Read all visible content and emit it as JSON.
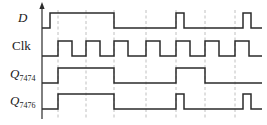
{
  "figure": {
    "type": "digital-timing-diagram",
    "width": 267,
    "height": 125,
    "background_color": "#ffffff",
    "wave_color": "#2b2b2b",
    "grid_color": "#b9b9b9"
  },
  "axis": {
    "name": "vertical-time-axis",
    "x": 42,
    "y_top": 8,
    "y_bottom": 119,
    "arrow": "up-arrow"
  },
  "gridlines": {
    "x_positions": [
      58,
      86,
      114,
      146,
      176,
      205,
      235
    ],
    "y_top": 10,
    "y_bottom": 120,
    "style": "dashed"
  },
  "signals": [
    {
      "name": "D",
      "label": "D",
      "label_style": "italic",
      "subscript": "",
      "label_x": 18,
      "label_y": 22,
      "row_high_y": 13,
      "row_low_y": 28,
      "start_level": 0,
      "transitions_x": [
        50,
        114,
        176,
        184,
        243,
        251
      ],
      "description": "data input: long high pulse then two narrow pulses"
    },
    {
      "name": "Clk",
      "label": "Clk",
      "label_style": "roman",
      "subscript": "",
      "label_x": 12,
      "label_y": 50,
      "row_high_y": 41,
      "row_low_y": 56,
      "start_level": 0,
      "transitions_x": [
        58,
        72,
        86,
        100,
        114,
        128,
        146,
        160,
        176,
        190,
        205,
        219,
        235,
        249
      ],
      "description": "clock: regular square wave"
    },
    {
      "name": "Q7474",
      "label": "Q",
      "label_style": "italic",
      "subscript": "7474",
      "label_x": 10,
      "label_y": 78,
      "row_high_y": 68,
      "row_low_y": 83,
      "start_level": 0,
      "transitions_x": [
        58,
        114,
        176,
        205
      ],
      "description": "7474 edge-triggered flip-flop output"
    },
    {
      "name": "Q7476",
      "label": "Q",
      "label_style": "italic",
      "subscript": "7476",
      "label_x": 10,
      "label_y": 105,
      "row_high_y": 94,
      "row_low_y": 109,
      "start_level": 0,
      "transitions_x": [
        58,
        114,
        176,
        184,
        243,
        251
      ],
      "description": "7476 master-slave flip-flop output"
    }
  ]
}
